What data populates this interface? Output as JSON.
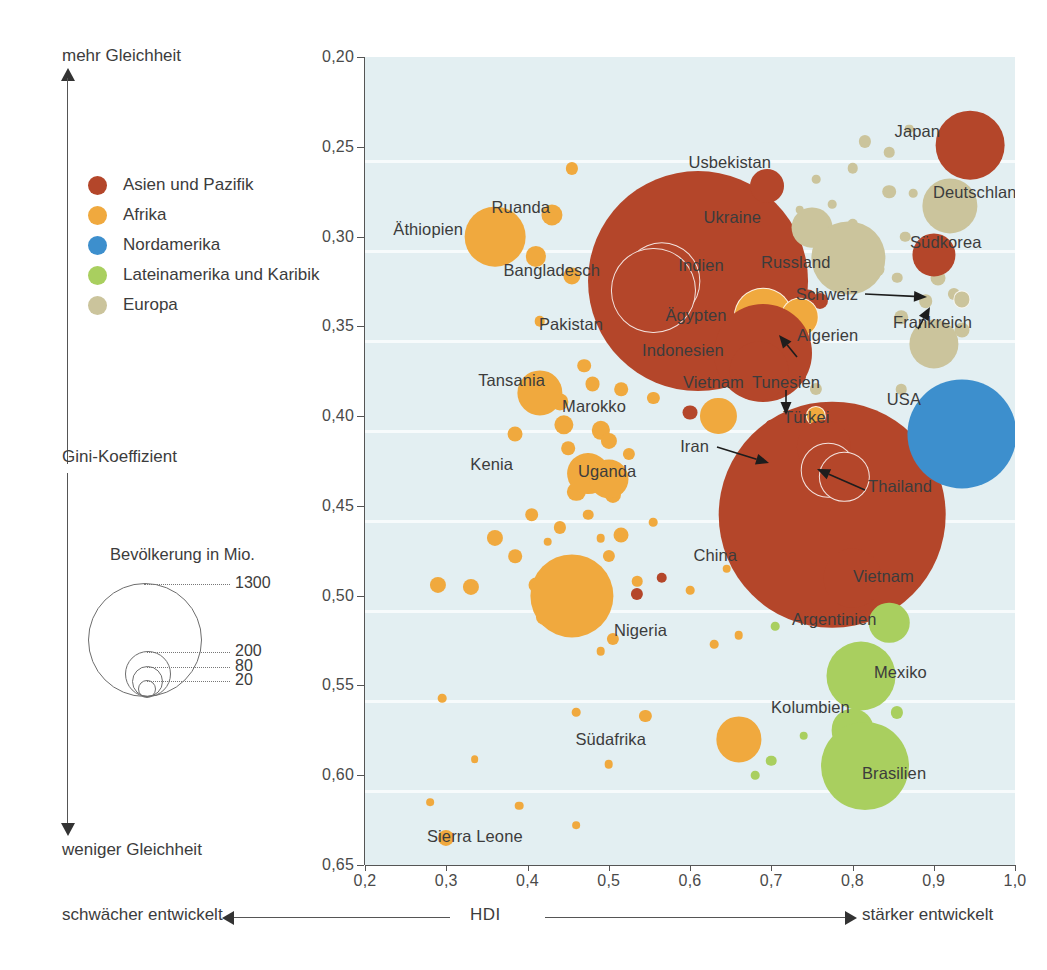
{
  "axes": {
    "y_label": "Gini-Koeffizient",
    "y_top_note": "mehr Gleichheit",
    "y_bottom_note": "weniger Gleichheit",
    "x_label": "HDI",
    "x_left_note": "schwächer entwickelt",
    "x_right_note": "stärker entwickelt",
    "y_ticks": [
      "0,20",
      "0,25",
      "0,30",
      "0,35",
      "0,40",
      "0,45",
      "0,50",
      "0,55",
      "0,60",
      "0,65"
    ],
    "x_ticks": [
      "0,2",
      "0,3",
      "0,4",
      "0,5",
      "0,6",
      "0,7",
      "0,8",
      "0,9",
      "1,0"
    ]
  },
  "legend": {
    "items": [
      {
        "label": "Asien und Pazifik",
        "color": "#b4462a"
      },
      {
        "label": "Afrika",
        "color": "#f0a93e"
      },
      {
        "label": "Nordamerika",
        "color": "#3d8fcd"
      },
      {
        "label": "Lateinamerika und Karibik",
        "color": "#a9cf5f"
      },
      {
        "label": "Europa",
        "color": "#cbc49c"
      }
    ]
  },
  "size_legend": {
    "title": "Bevölkerung in Mio.",
    "values": [
      "1300",
      "200",
      "80",
      "20"
    ]
  },
  "chart_data": {
    "type": "scatter",
    "title": "",
    "xlabel": "HDI",
    "ylabel": "Gini-Koeffizient",
    "xlim": [
      0.2,
      1.0
    ],
    "ylim": [
      0.2,
      0.65
    ],
    "y_inverted": true,
    "grid": false,
    "legend_position": "left",
    "size_encoding": "Bevölkerung in Mio.",
    "size_legend_values": [
      1300,
      200,
      80,
      20
    ],
    "series": [
      {
        "name": "Asien und Pazifik",
        "color": "#b4462a"
      },
      {
        "name": "Afrika",
        "color": "#f0a93e"
      },
      {
        "name": "Nordamerika",
        "color": "#3d8fcd"
      },
      {
        "name": "Lateinamerika und Karibik",
        "color": "#a9cf5f"
      },
      {
        "name": "Europa",
        "color": "#cbc49c"
      }
    ],
    "points": [
      {
        "label": "Japan",
        "region": "Asien und Pazifik",
        "hdi": 0.945,
        "gini": 0.249,
        "pop": 127
      },
      {
        "label": "Deutschland",
        "region": "Europa",
        "hdi": 0.92,
        "gini": 0.283,
        "pop": 82
      },
      {
        "label": "Südkorea",
        "region": "Asien und Pazifik",
        "hdi": 0.9,
        "gini": 0.31,
        "pop": 50
      },
      {
        "label": "Schweiz",
        "region": "Europa",
        "hdi": 0.935,
        "gini": 0.335,
        "pop": 8
      },
      {
        "label": "Frankreich",
        "region": "Europa",
        "hdi": 0.9,
        "gini": 0.36,
        "pop": 65
      },
      {
        "label": "USA",
        "region": "Nordamerika",
        "hdi": 0.935,
        "gini": 0.41,
        "pop": 320
      },
      {
        "label": "Usbekistan",
        "region": "Asien und Pazifik",
        "hdi": 0.695,
        "gini": 0.272,
        "pop": 31
      },
      {
        "label": "Ukraine",
        "region": "Europa",
        "hdi": 0.75,
        "gini": 0.295,
        "pop": 45
      },
      {
        "label": "Russland",
        "region": "Europa",
        "hdi": 0.795,
        "gini": 0.312,
        "pop": 144
      },
      {
        "label": "Äthiopien",
        "region": "Afrika",
        "hdi": 0.36,
        "gini": 0.3,
        "pop": 99
      },
      {
        "label": "Ruanda",
        "region": "Afrika",
        "hdi": 0.43,
        "gini": 0.288,
        "pop": 12
      },
      {
        "label": "Bangladesch",
        "region": "Asien und Pazifik",
        "hdi": 0.565,
        "gini": 0.325,
        "pop": 161
      },
      {
        "label": "Indien",
        "region": "Asien und Pazifik",
        "hdi": 0.61,
        "gini": 0.325,
        "pop": 1300
      },
      {
        "label": "Pakistan",
        "region": "Asien und Pazifik",
        "hdi": 0.555,
        "gini": 0.33,
        "pop": 190
      },
      {
        "label": "Ägypten",
        "region": "Afrika",
        "hdi": 0.69,
        "gini": 0.345,
        "pop": 92
      },
      {
        "label": "Algerien",
        "region": "Afrika",
        "hdi": 0.735,
        "gini": 0.345,
        "pop": 40
      },
      {
        "label": "Indonesien",
        "region": "Asien und Pazifik",
        "hdi": 0.69,
        "gini": 0.365,
        "pop": 258
      },
      {
        "label": "Vietnam",
        "region": "Asien und Pazifik",
        "hdi": 0.685,
        "gini": 0.375,
        "pop": 93
      },
      {
        "label": "Tansania",
        "region": "Afrika",
        "hdi": 0.415,
        "gini": 0.387,
        "pop": 55
      },
      {
        "label": "Marokko",
        "region": "Afrika",
        "hdi": 0.635,
        "gini": 0.4,
        "pop": 35
      },
      {
        "label": "Tunesien",
        "region": "Afrika",
        "hdi": 0.755,
        "gini": 0.4,
        "pop": 11
      },
      {
        "label": "Türkei",
        "region": "Asien und Pazifik",
        "hdi": 0.765,
        "gini": 0.417,
        "pop": 79
      },
      {
        "label": "Kenia",
        "region": "Afrika",
        "hdi": 0.475,
        "gini": 0.432,
        "pop": 47
      },
      {
        "label": "Uganda",
        "region": "Afrika",
        "hdi": 0.5,
        "gini": 0.435,
        "pop": 41
      },
      {
        "label": "Iran",
        "region": "Asien und Pazifik",
        "hdi": 0.77,
        "gini": 0.43,
        "pop": 80
      },
      {
        "label": "Thailand",
        "region": "Asien und Pazifik",
        "hdi": 0.79,
        "gini": 0.434,
        "pop": 68
      },
      {
        "label": "China",
        "region": "Asien und Pazifik",
        "hdi": 0.775,
        "gini": 0.455,
        "pop": 1380
      },
      {
        "label": "Vietnam",
        "region": "Asien und Pazifik",
        "hdi": 0.8,
        "gini": 0.49,
        "pop": 93
      },
      {
        "label": "Nigeria",
        "region": "Afrika",
        "hdi": 0.455,
        "gini": 0.5,
        "pop": 186
      },
      {
        "label": "Argentinien",
        "region": "Lateinamerika und Karibik",
        "hdi": 0.845,
        "gini": 0.515,
        "pop": 44
      },
      {
        "label": "Mexiko",
        "region": "Lateinamerika und Karibik",
        "hdi": 0.81,
        "gini": 0.545,
        "pop": 128
      },
      {
        "label": "Kolumbien",
        "region": "Lateinamerika und Karibik",
        "hdi": 0.8,
        "gini": 0.575,
        "pop": 49
      },
      {
        "label": "Südafrika",
        "region": "Afrika",
        "hdi": 0.66,
        "gini": 0.58,
        "pop": 55
      },
      {
        "label": "Brasilien",
        "region": "Lateinamerika und Karibik",
        "hdi": 0.815,
        "gini": 0.595,
        "pop": 208
      },
      {
        "label": "Sierra Leone",
        "region": "Afrika",
        "hdi": 0.3,
        "gini": 0.635,
        "pop": 7
      }
    ],
    "callouts": [
      "Schweiz",
      "Frankreich",
      "Ägypten",
      "Tunesien",
      "Iran",
      "Thailand"
    ]
  }
}
